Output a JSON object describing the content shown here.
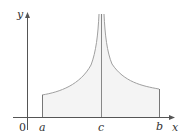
{
  "figure": {
    "axes": {
      "x_label": "x",
      "y_label": "y",
      "origin_label": "0"
    },
    "ticks": {
      "a": "a",
      "c": "c",
      "b": "b"
    },
    "colors": {
      "axis": "#555555",
      "curve": "#a0a0a0",
      "fill": "#f4f4f4",
      "line": "#777777"
    }
  }
}
